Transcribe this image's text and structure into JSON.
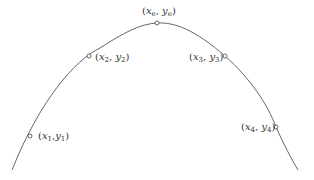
{
  "diagram": {
    "type": "parabolic-curve-with-labeled-points",
    "curve": {
      "stroke_color": "#555555",
      "start": [
        12,
        170
      ],
      "end": [
        298,
        170
      ]
    },
    "marker_color": "#555555",
    "points": [
      {
        "id": "p1",
        "x": 30,
        "y": 136,
        "var_x": "x",
        "sub_x": "1",
        "var_y": "y",
        "sub_y": "1",
        "label_left": 38,
        "label_top": 131,
        "comma": ","
      },
      {
        "id": "p2",
        "x": 89,
        "y": 56,
        "var_x": "x",
        "sub_x": "2",
        "var_y": "y",
        "sub_y": "2",
        "label_left": 95,
        "label_top": 52,
        "comma": ", "
      },
      {
        "id": "pe",
        "x": 157,
        "y": 23,
        "var_x": "x",
        "sub_x": "e",
        "var_y": "y",
        "sub_y": "e",
        "label_left": 143,
        "label_top": 6,
        "comma": ", "
      },
      {
        "id": "p3",
        "x": 225,
        "y": 56,
        "var_x": "x",
        "sub_x": "3",
        "var_y": "y",
        "sub_y": "3",
        "label_left": 189,
        "label_top": 52,
        "comma": ", "
      },
      {
        "id": "p4",
        "x": 276,
        "y": 127,
        "var_x": "x",
        "sub_x": "4",
        "var_y": "y",
        "sub_y": "4",
        "label_left": 241,
        "label_top": 122,
        "comma": ", "
      }
    ]
  },
  "labels": {
    "p1": {
      "open": "(",
      "x": "x",
      "sx": "1",
      "comma": ",",
      "y": "y",
      "sy": "1",
      "close": ")"
    },
    "p2": {
      "open": "(",
      "x": "x",
      "sx": "2",
      "comma": ", ",
      "y": "y",
      "sy": "2",
      "close": ")"
    },
    "pe": {
      "open": "(",
      "x": "x",
      "sx": "e",
      "comma": ", ",
      "y": "y",
      "sy": "e",
      "close": ")"
    },
    "p3": {
      "open": "(",
      "x": "x",
      "sx": "3",
      "comma": ", ",
      "y": "y",
      "sy": "3",
      "close": ")"
    },
    "p4": {
      "open": "(",
      "x": "x",
      "sx": "4",
      "comma": ", ",
      "y": "y",
      "sy": "4",
      "close": ")"
    }
  }
}
